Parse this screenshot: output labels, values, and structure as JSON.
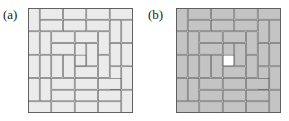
{
  "figure": {
    "panels": [
      {
        "id": "panel-a",
        "label": "(a)",
        "tiling": {
          "grid": 9,
          "cell_px": 11.6667,
          "tile_fill": "#ebebeb",
          "tile_stroke": "#4d4d4d",
          "center_cell_fill": "#ebebeb",
          "background": "#ffffff",
          "description": "9 by 9 square tiled by 2x1 dominoes in a spiral pattern with one leftover unit cell at the center",
          "dominoes": [
            {
              "x": 0,
              "y": 0,
              "w": 1,
              "h": 2
            },
            {
              "x": 1,
              "y": 0,
              "w": 2,
              "h": 1
            },
            {
              "x": 3,
              "y": 0,
              "w": 2,
              "h": 1
            },
            {
              "x": 5,
              "y": 0,
              "w": 2,
              "h": 1
            },
            {
              "x": 7,
              "y": 0,
              "w": 2,
              "h": 1
            },
            {
              "x": 8,
              "y": 1,
              "w": 1,
              "h": 2
            },
            {
              "x": 1,
              "y": 1,
              "w": 2,
              "h": 1
            },
            {
              "x": 3,
              "y": 1,
              "w": 2,
              "h": 1
            },
            {
              "x": 5,
              "y": 1,
              "w": 2,
              "h": 1
            },
            {
              "x": 7,
              "y": 1,
              "w": 1,
              "h": 2
            },
            {
              "x": 0,
              "y": 2,
              "w": 1,
              "h": 2
            },
            {
              "x": 1,
              "y": 2,
              "w": 1,
              "h": 2
            },
            {
              "x": 2,
              "y": 2,
              "w": 2,
              "h": 1
            },
            {
              "x": 4,
              "y": 2,
              "w": 2,
              "h": 1
            },
            {
              "x": 6,
              "y": 2,
              "w": 1,
              "h": 2
            },
            {
              "x": 8,
              "y": 3,
              "w": 1,
              "h": 2
            },
            {
              "x": 2,
              "y": 3,
              "w": 2,
              "h": 1
            },
            {
              "x": 4,
              "y": 3,
              "w": 1,
              "h": 2
            },
            {
              "x": 5,
              "y": 3,
              "w": 1,
              "h": 2
            },
            {
              "x": 7,
              "y": 3,
              "w": 1,
              "h": 2
            },
            {
              "x": 0,
              "y": 4,
              "w": 1,
              "h": 2
            },
            {
              "x": 1,
              "y": 4,
              "w": 1,
              "h": 2
            },
            {
              "x": 2,
              "y": 4,
              "w": 1,
              "h": 2
            },
            {
              "x": 3,
              "y": 4,
              "w": 1,
              "h": 2
            },
            {
              "x": 6,
              "y": 4,
              "w": 1,
              "h": 2
            },
            {
              "x": 4,
              "y": 5,
              "w": 2,
              "h": 1
            },
            {
              "x": 7,
              "y": 5,
              "w": 1,
              "h": 2
            },
            {
              "x": 8,
              "y": 5,
              "w": 1,
              "h": 2
            },
            {
              "x": 2,
              "y": 6,
              "w": 2,
              "h": 1
            },
            {
              "x": 4,
              "y": 6,
              "w": 2,
              "h": 1
            },
            {
              "x": 6,
              "y": 6,
              "w": 2,
              "h": 1
            },
            {
              "x": 0,
              "y": 6,
              "w": 1,
              "h": 2
            },
            {
              "x": 1,
              "y": 6,
              "w": 1,
              "h": 2
            },
            {
              "x": 2,
              "y": 7,
              "w": 2,
              "h": 1
            },
            {
              "x": 4,
              "y": 7,
              "w": 2,
              "h": 1
            },
            {
              "x": 6,
              "y": 7,
              "w": 2,
              "h": 1
            },
            {
              "x": 8,
              "y": 7,
              "w": 1,
              "h": 2
            },
            {
              "x": 0,
              "y": 8,
              "w": 2,
              "h": 1
            },
            {
              "x": 2,
              "y": 8,
              "w": 2,
              "h": 1
            },
            {
              "x": 4,
              "y": 8,
              "w": 2,
              "h": 1
            },
            {
              "x": 6,
              "y": 8,
              "w": 2,
              "h": 1
            }
          ],
          "center_cell": {
            "x": 4,
            "y": 4
          }
        }
      },
      {
        "id": "panel-b",
        "label": "(b)",
        "tiling": {
          "grid": 9,
          "cell_px": 11.6667,
          "tile_fill": "#c4c4c4",
          "tile_stroke": "#4d4d4d",
          "center_cell_fill": "#ffffff",
          "background": "#ffffff",
          "description": "9 by 9 square tiled by 2x1 dominoes in a spiral pattern with one uncovered white unit cell at the center",
          "dominoes": [
            {
              "x": 0,
              "y": 0,
              "w": 1,
              "h": 2
            },
            {
              "x": 1,
              "y": 0,
              "w": 2,
              "h": 1
            },
            {
              "x": 3,
              "y": 0,
              "w": 2,
              "h": 1
            },
            {
              "x": 5,
              "y": 0,
              "w": 2,
              "h": 1
            },
            {
              "x": 7,
              "y": 0,
              "w": 2,
              "h": 1
            },
            {
              "x": 8,
              "y": 1,
              "w": 1,
              "h": 2
            },
            {
              "x": 1,
              "y": 1,
              "w": 2,
              "h": 1
            },
            {
              "x": 3,
              "y": 1,
              "w": 2,
              "h": 1
            },
            {
              "x": 5,
              "y": 1,
              "w": 2,
              "h": 1
            },
            {
              "x": 7,
              "y": 1,
              "w": 1,
              "h": 2
            },
            {
              "x": 0,
              "y": 2,
              "w": 1,
              "h": 2
            },
            {
              "x": 1,
              "y": 2,
              "w": 1,
              "h": 2
            },
            {
              "x": 2,
              "y": 2,
              "w": 2,
              "h": 1
            },
            {
              "x": 4,
              "y": 2,
              "w": 2,
              "h": 1
            },
            {
              "x": 6,
              "y": 2,
              "w": 1,
              "h": 2
            },
            {
              "x": 8,
              "y": 3,
              "w": 1,
              "h": 2
            },
            {
              "x": 2,
              "y": 3,
              "w": 2,
              "h": 1
            },
            {
              "x": 4,
              "y": 3,
              "w": 1,
              "h": 2
            },
            {
              "x": 5,
              "y": 3,
              "w": 1,
              "h": 2
            },
            {
              "x": 7,
              "y": 3,
              "w": 1,
              "h": 2
            },
            {
              "x": 0,
              "y": 4,
              "w": 1,
              "h": 2
            },
            {
              "x": 1,
              "y": 4,
              "w": 1,
              "h": 2
            },
            {
              "x": 2,
              "y": 4,
              "w": 1,
              "h": 2
            },
            {
              "x": 3,
              "y": 4,
              "w": 1,
              "h": 2
            },
            {
              "x": 6,
              "y": 4,
              "w": 1,
              "h": 2
            },
            {
              "x": 4,
              "y": 5,
              "w": 2,
              "h": 1
            },
            {
              "x": 7,
              "y": 5,
              "w": 1,
              "h": 2
            },
            {
              "x": 8,
              "y": 5,
              "w": 1,
              "h": 2
            },
            {
              "x": 2,
              "y": 6,
              "w": 2,
              "h": 1
            },
            {
              "x": 4,
              "y": 6,
              "w": 2,
              "h": 1
            },
            {
              "x": 6,
              "y": 6,
              "w": 2,
              "h": 1
            },
            {
              "x": 0,
              "y": 6,
              "w": 1,
              "h": 2
            },
            {
              "x": 1,
              "y": 6,
              "w": 1,
              "h": 2
            },
            {
              "x": 2,
              "y": 7,
              "w": 2,
              "h": 1
            },
            {
              "x": 4,
              "y": 7,
              "w": 2,
              "h": 1
            },
            {
              "x": 6,
              "y": 7,
              "w": 2,
              "h": 1
            },
            {
              "x": 8,
              "y": 7,
              "w": 1,
              "h": 2
            },
            {
              "x": 0,
              "y": 8,
              "w": 2,
              "h": 1
            },
            {
              "x": 2,
              "y": 8,
              "w": 2,
              "h": 1
            },
            {
              "x": 4,
              "y": 8,
              "w": 2,
              "h": 1
            },
            {
              "x": 6,
              "y": 8,
              "w": 2,
              "h": 1
            }
          ],
          "center_cell": {
            "x": 4,
            "y": 4
          }
        }
      }
    ]
  }
}
